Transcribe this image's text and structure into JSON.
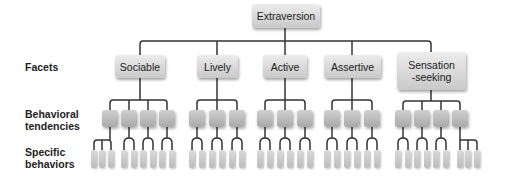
{
  "root": {
    "label": "Extraversion"
  },
  "row_labels": {
    "facets": "Facets",
    "tendencies_line1": "Behavioral",
    "tendencies_line2": "tendencies",
    "behaviors_line1": "Specific",
    "behaviors_line2": "behaviors"
  },
  "facets": [
    {
      "label": "Sociable",
      "tendencies": 4,
      "behaviors_per_tendency": [
        3,
        2,
        2,
        2
      ]
    },
    {
      "label": "Lively",
      "tendencies": 3,
      "behaviors_per_tendency": [
        2,
        2,
        2
      ]
    },
    {
      "label": "Active",
      "tendencies": 3,
      "behaviors_per_tendency": [
        2,
        2,
        2
      ]
    },
    {
      "label": "Assertive",
      "tendencies": 3,
      "behaviors_per_tendency": [
        2,
        2,
        2
      ]
    },
    {
      "label_line1": "Sensation",
      "label_line2": "-seeking",
      "tendencies": 4,
      "behaviors_per_tendency": [
        2,
        2,
        2,
        3
      ]
    }
  ],
  "colors": {
    "line": "#333333",
    "node_top": "#ececec",
    "node_bottom": "#c9c9c9",
    "text": "#222222"
  }
}
